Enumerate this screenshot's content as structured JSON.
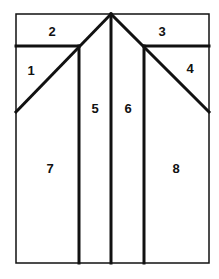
{
  "diagram": {
    "type": "segmented-region-diagram",
    "regions": [
      {
        "id": "1",
        "label": "1",
        "x": 31,
        "y": 70
      },
      {
        "id": "2",
        "label": "2",
        "x": 52,
        "y": 32
      },
      {
        "id": "3",
        "label": "3",
        "x": 162,
        "y": 32
      },
      {
        "id": "4",
        "label": "4",
        "x": 190,
        "y": 70
      },
      {
        "id": "5",
        "label": "5",
        "x": 95,
        "y": 112
      },
      {
        "id": "6",
        "label": "6",
        "x": 128,
        "y": 112
      },
      {
        "id": "7",
        "label": "7",
        "x": 50,
        "y": 172
      },
      {
        "id": "8",
        "label": "8",
        "x": 176,
        "y": 172
      }
    ],
    "line_color": "#111111",
    "background": "#ffffff"
  }
}
